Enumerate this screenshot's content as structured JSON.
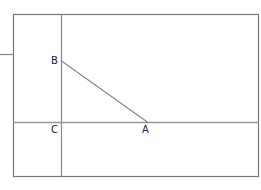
{
  "diagram": {
    "type": "geometry-figure",
    "colors": {
      "frame": "#777777",
      "line": "#888888",
      "label": "#222222"
    },
    "points": [
      {
        "id": "B",
        "label": "B",
        "x": 61,
        "y": 61,
        "label_x": 51,
        "label_y": 64
      },
      {
        "id": "C",
        "label": "C",
        "x": 61,
        "y": 122,
        "label_x": 51,
        "label_y": 133
      },
      {
        "id": "A",
        "label": "A",
        "x": 148,
        "y": 122,
        "label_x": 142,
        "label_y": 133
      }
    ],
    "segments": [
      {
        "from": "B",
        "to": "A"
      }
    ]
  }
}
